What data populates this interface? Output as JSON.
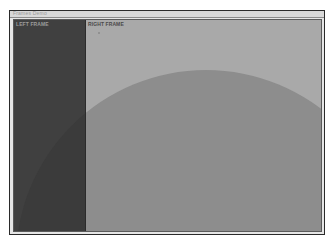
{
  "window": {
    "title": "Frames Demo"
  },
  "frames": {
    "left": {
      "label": "LEFT FRAME"
    },
    "right": {
      "label": "RIGHT FRAME"
    }
  },
  "colors": {
    "left_frame_bg": "#404040",
    "right_frame_bg": "#a9a9a9",
    "circle_overlay": "rgba(40,40,40,0.22)"
  }
}
